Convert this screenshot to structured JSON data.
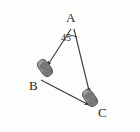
{
  "figure": {
    "background_color": "#fdfdfc",
    "stroke_color": "#3a3a3a",
    "labels": {
      "vertex_a": "A",
      "vertex_b": "B",
      "vertex_c": "C",
      "angle_a": "45"
    },
    "vertices": [
      {
        "id": "A",
        "label": "A",
        "x": 72,
        "y": 26
      },
      {
        "id": "B",
        "label": "B",
        "x": 40,
        "y": 78
      },
      {
        "id": "C",
        "label": "C",
        "x": 95,
        "y": 108
      }
    ],
    "segments": [
      {
        "id": "AB",
        "from": "A",
        "to": "B",
        "arrow": true
      },
      {
        "id": "AC",
        "from": "A",
        "to": "C",
        "arrow": true
      },
      {
        "id": "BC",
        "from": "B",
        "to": "C",
        "arrow": true
      }
    ],
    "angle_mark": {
      "at": "A",
      "value": "45",
      "unit": "degrees"
    },
    "icons": [
      {
        "id": "car-at-B",
        "name": "car-icon",
        "x": 45,
        "y": 68,
        "rotation": -35,
        "color": "#8a8a8a"
      },
      {
        "id": "car-at-C",
        "name": "car-icon",
        "x": 90,
        "y": 98,
        "rotation": -35,
        "color": "#8a8a8a"
      }
    ]
  }
}
